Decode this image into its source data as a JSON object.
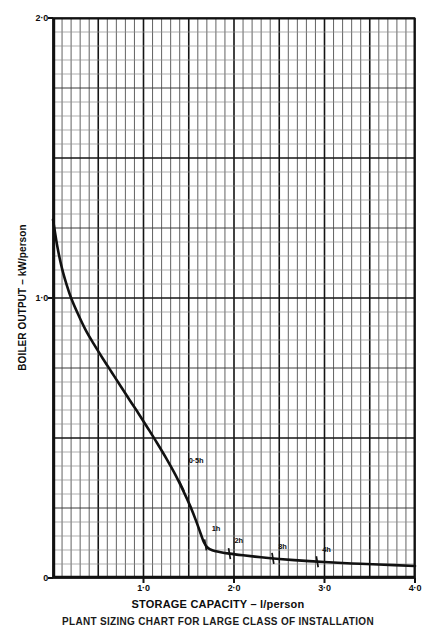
{
  "chart_data": {
    "type": "line",
    "title": "",
    "caption": "PLANT SIZING CHART FOR LARGE CLASS OF INSTALLATION",
    "xlabel": "STORAGE CAPACITY – l/person",
    "ylabel": "BOILER OUTPUT – kW/person",
    "xlim": [
      0,
      4.0
    ],
    "ylim": [
      0,
      2.0
    ],
    "grid": true,
    "legend_position": "none",
    "x_ticks": [
      {
        "value": 0,
        "label": ""
      },
      {
        "value": 1.0,
        "label": "1·0"
      },
      {
        "value": 2.0,
        "label": "2·0"
      },
      {
        "value": 3.0,
        "label": "3·0"
      },
      {
        "value": 4.0,
        "label": "4·0"
      }
    ],
    "y_ticks": [
      {
        "value": 0,
        "label": "0"
      },
      {
        "value": 0.5,
        "label": ""
      },
      {
        "value": 1.0,
        "label": "1·0"
      },
      {
        "value": 1.5,
        "label": ""
      },
      {
        "value": 2.0,
        "label": "2·0"
      }
    ],
    "minor_grid_step_x": 0.1,
    "minor_grid_step_y": 0.05,
    "major_grid_step_x": 0.5,
    "major_grid_step_y": 0.25,
    "series": [
      {
        "name": "Boiler output vs storage capacity",
        "color": "#111111",
        "points": [
          [
            0.0,
            1.28
          ],
          [
            0.05,
            1.18
          ],
          [
            0.1,
            1.105
          ],
          [
            0.15,
            1.048
          ],
          [
            0.2,
            1.0
          ],
          [
            0.28,
            0.94
          ],
          [
            0.36,
            0.886
          ],
          [
            0.45,
            0.836
          ],
          [
            0.55,
            0.784
          ],
          [
            0.65,
            0.734
          ],
          [
            0.75,
            0.684
          ],
          [
            0.85,
            0.634
          ],
          [
            0.95,
            0.585
          ],
          [
            1.05,
            0.534
          ],
          [
            1.15,
            0.482
          ],
          [
            1.25,
            0.428
          ],
          [
            1.35,
            0.37
          ],
          [
            1.45,
            0.304
          ],
          [
            1.52,
            0.254
          ],
          [
            1.58,
            0.205
          ],
          [
            1.63,
            0.16
          ],
          [
            1.67,
            0.126
          ],
          [
            1.71,
            0.108
          ],
          [
            1.76,
            0.099
          ],
          [
            1.84,
            0.093
          ],
          [
            1.95,
            0.087
          ],
          [
            2.1,
            0.081
          ],
          [
            2.3,
            0.074
          ],
          [
            2.5,
            0.068
          ],
          [
            2.75,
            0.062
          ],
          [
            3.0,
            0.057
          ],
          [
            3.3,
            0.052
          ],
          [
            3.6,
            0.048
          ],
          [
            4.0,
            0.043
          ]
        ]
      }
    ],
    "annotations": [
      {
        "label": "0·5h",
        "marker_x": 1.42,
        "marker_y": 0.33,
        "label_x": 1.5,
        "label_y": 0.415
      },
      {
        "label": "1h",
        "marker_x": 1.685,
        "marker_y": 0.118,
        "label_x": 1.755,
        "label_y": 0.17
      },
      {
        "label": "2h",
        "marker_x": 1.95,
        "marker_y": 0.087,
        "label_x": 2.005,
        "label_y": 0.128
      },
      {
        "label": "3h",
        "marker_x": 2.43,
        "marker_y": 0.07,
        "label_x": 2.49,
        "label_y": 0.108
      },
      {
        "label": "4h",
        "marker_x": 2.92,
        "marker_y": 0.058,
        "label_x": 2.975,
        "label_y": 0.097
      }
    ]
  }
}
